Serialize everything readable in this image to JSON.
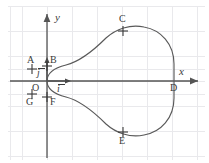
{
  "figure": {
    "kind": "cartesian-plot",
    "background_color": "#ffffff",
    "grid": {
      "visible": true,
      "color": "#e9e9ec",
      "spacing_px": 25,
      "origin_px": {
        "x": 47,
        "y": 81
      }
    },
    "axes": {
      "color": "#555555",
      "x_label": "x",
      "y_label": "y",
      "x_axis_y_px": 81,
      "y_axis_x_px": 47
    },
    "vectors": [
      {
        "name": "i-hat",
        "label": "i",
        "overbar": true,
        "direction": "right",
        "from_px": {
          "x": 47,
          "y": 81
        },
        "to_px": {
          "x": 72,
          "y": 81
        }
      },
      {
        "name": "j-hat",
        "label": "j",
        "overbar": true,
        "direction": "up",
        "from_px": {
          "x": 47,
          "y": 81
        },
        "to_px": {
          "x": 47,
          "y": 56
        }
      }
    ],
    "curve": {
      "name": "cardioid-like-closed-curve",
      "color": "#595959",
      "stroke_width": 1.1,
      "closed": true,
      "cusp_px": {
        "x": 47,
        "y": 81
      }
    },
    "points": [
      {
        "id": "A",
        "label": "A",
        "marker": "cross",
        "px": {
          "x": 32,
          "y": 69
        },
        "label_px": {
          "x": 27,
          "y": 56
        }
      },
      {
        "id": "B",
        "label": "B",
        "marker": "cross",
        "px": {
          "x": 47,
          "y": 69
        },
        "label_px": {
          "x": 50,
          "y": 56
        }
      },
      {
        "id": "C",
        "label": "C",
        "marker": "cross",
        "px": {
          "x": 123,
          "y": 31
        },
        "label_px": {
          "x": 119,
          "y": 15
        }
      },
      {
        "id": "D",
        "label": "D",
        "marker": "none",
        "px": {
          "x": 172,
          "y": 81
        },
        "label_px": {
          "x": 171,
          "y": 84
        }
      },
      {
        "id": "E",
        "label": "E",
        "marker": "cross",
        "px": {
          "x": 123,
          "y": 132
        },
        "label_px": {
          "x": 119,
          "y": 137
        }
      },
      {
        "id": "F",
        "label": "F",
        "marker": "cross",
        "px": {
          "x": 47,
          "y": 94
        },
        "label_px": {
          "x": 50,
          "y": 98
        }
      },
      {
        "id": "G",
        "label": "G",
        "marker": "cross",
        "px": {
          "x": 32,
          "y": 94
        },
        "label_px": {
          "x": 27,
          "y": 98
        }
      },
      {
        "id": "O",
        "label": "O",
        "marker": "none",
        "px": {
          "x": 47,
          "y": 81
        },
        "label_px": {
          "x": 33,
          "y": 84
        }
      }
    ]
  }
}
